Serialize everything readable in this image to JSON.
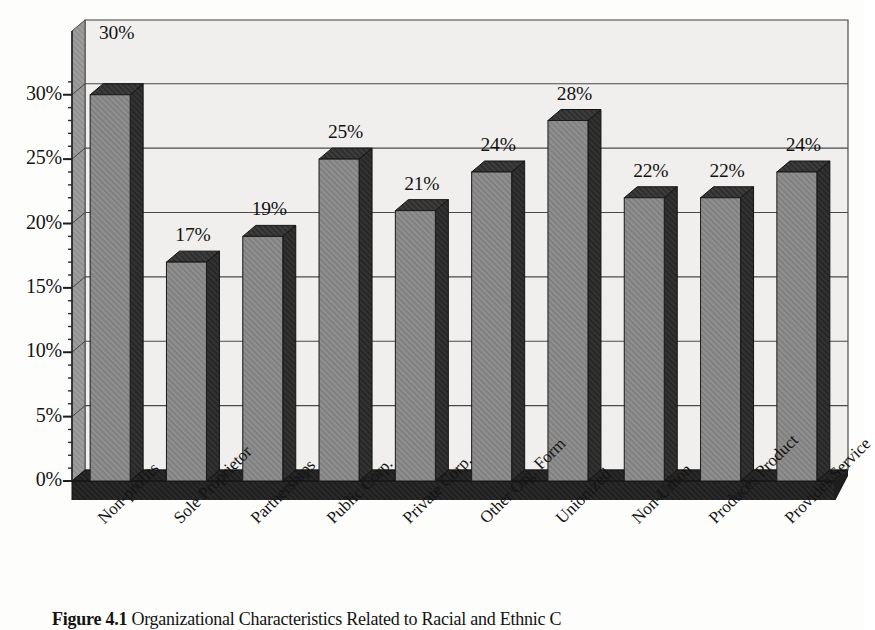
{
  "chart_data": {
    "type": "bar",
    "title": "",
    "xlabel": "",
    "ylabel": "",
    "ylim": [
      0,
      32
    ],
    "grid": true,
    "legend": null,
    "style": "3d-column-grayscale-scan",
    "categories": [
      "Non-profits",
      "Sole Proprietor",
      "Partnerships",
      "Public Corp.",
      "Private Corp.",
      "Other Org. Form",
      "Unionized",
      "Non-Union",
      "Produces Product",
      "Provides Service"
    ],
    "values": [
      30,
      17,
      19,
      25,
      21,
      24,
      28,
      22,
      22,
      24
    ],
    "data_labels": [
      "30%",
      "17%",
      "19%",
      "25%",
      "21%",
      "24%",
      "28%",
      "22%",
      "22%",
      "24%"
    ],
    "ytick_values": [
      0,
      5,
      10,
      15,
      20,
      25,
      30
    ],
    "ytick_labels": [
      "0%",
      "5%",
      "10%",
      "15%",
      "20%",
      "25%",
      "30%"
    ],
    "minor_ticks": true
  },
  "caption": {
    "figure_number": "Figure 4.1",
    "text": "Organizational Characteristics Related to Racial and Ethnic C"
  },
  "colors": {
    "bar_front": "#8e8e8e",
    "bar_top": "#3a3a3a",
    "bar_side": "#2e2e2e",
    "floor": "#262626",
    "wall_back": "#f0efed",
    "wall_left": "#9a9a9a",
    "gridline": "#4a4a4a",
    "text": "#131313",
    "paper": "#fdfdfc"
  }
}
